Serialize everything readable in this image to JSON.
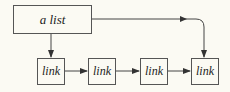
{
  "diagram": {
    "head": {
      "label": "a list"
    },
    "links": [
      {
        "label": "link"
      },
      {
        "label": "link"
      },
      {
        "label": "link"
      },
      {
        "label": "link"
      }
    ],
    "stroke_color": "#444444",
    "background": "#fbfaf3"
  }
}
